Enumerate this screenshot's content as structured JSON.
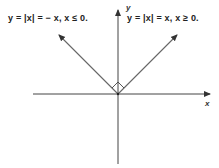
{
  "diagram": {
    "labels": {
      "left_ray": "y = |x| = − x, x ≤ 0.",
      "right_ray": "y = |x| = x, x ≥ 0.",
      "x_axis": "x",
      "y_axis": "y"
    },
    "colors": {
      "axis": "#333333",
      "ray": "#555555",
      "text": "#222222"
    },
    "elements": {
      "origin": [
        118,
        94
      ],
      "right_angle_marker": true,
      "left_ray_end": [
        58,
        34
      ],
      "right_ray_end": [
        178,
        34
      ]
    }
  }
}
